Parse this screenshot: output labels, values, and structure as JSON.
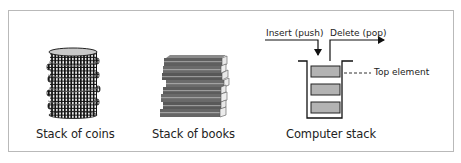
{
  "figure": {
    "panels": [
      {
        "id": "coins",
        "label": "Stack of coins",
        "icon": "coin-stack-icon"
      },
      {
        "id": "books",
        "label": "Stack of books",
        "icon": "book-stack-icon"
      },
      {
        "id": "computer",
        "label": "Computer stack",
        "icon": "stack-container-icon"
      }
    ],
    "computer_stack": {
      "insert_label": "Insert (push)",
      "delete_label": "Delete (pop)",
      "top_label": "Top element",
      "element_count": 3,
      "element_color": "#b3b3b3"
    }
  }
}
